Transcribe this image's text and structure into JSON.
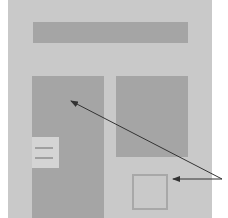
{
  "diagram": {
    "type": "page-layout-wireframe",
    "colors": {
      "background": "#ffffff",
      "page": "#c9c9c9",
      "block": "#a5a5a5",
      "menu_tab": "#d4d4d4",
      "outline": "#a8a8a8",
      "arrow": "#333333"
    },
    "elements": [
      {
        "name": "header-bar",
        "kind": "filled-rect"
      },
      {
        "name": "tall-column",
        "kind": "filled-rect"
      },
      {
        "name": "side-box",
        "kind": "filled-rect"
      },
      {
        "name": "hamburger-menu-tab",
        "kind": "menu-icon",
        "lines": 2
      },
      {
        "name": "outlined-square",
        "kind": "outline-rect"
      }
    ],
    "arrows": [
      {
        "from": "right-edge-point",
        "to": "tall-column"
      },
      {
        "from": "right-edge-point",
        "to": "outlined-square"
      }
    ]
  }
}
